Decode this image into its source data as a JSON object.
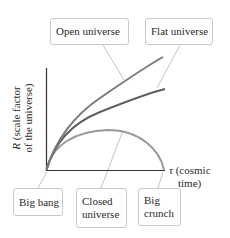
{
  "diagram": {
    "axes": {
      "y_symbol": "R",
      "y_label_line1": " (scale factor",
      "y_label_line2": "of the universe)",
      "x_symbol": "τ",
      "x_label_line1": " (cosmic",
      "x_label_line2": "time)"
    },
    "curves": [
      {
        "name": "open-universe",
        "color": "#7a7a7a"
      },
      {
        "name": "flat-universe",
        "color": "#5e5e5e"
      },
      {
        "name": "closed-universe",
        "color": "#9a9a9a"
      }
    ],
    "callouts": {
      "open_universe": "Open universe",
      "flat_universe": "Flat universe",
      "big_bang": "Big bang",
      "closed_universe_l1": "Closed",
      "closed_universe_l2": "universe",
      "big_crunch_l1": "Big",
      "big_crunch_l2": "crunch"
    },
    "colors": {
      "axis": "#333333",
      "leader": "#b5b5b5",
      "box_border": "#c8c8c8"
    }
  }
}
